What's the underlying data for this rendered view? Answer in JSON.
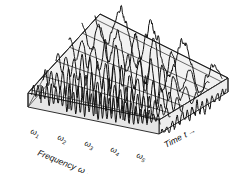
{
  "figure": {
    "name": "waterfall-spectrum-3d",
    "background_color": "#ffffff",
    "line_color": "#111111",
    "top_face_color": "#f2f2f2",
    "front_face_color": "#ededed"
  },
  "axes": {
    "frequency": {
      "title": "Frequency",
      "symbol": "ω",
      "arrow": "→",
      "title_full": "Frequency ω →",
      "tick_labels": [
        {
          "symbol": "ω",
          "sub": "1"
        },
        {
          "symbol": "ω",
          "sub": "2"
        },
        {
          "symbol": "ω",
          "sub": "3"
        },
        {
          "symbol": "ω",
          "sub": "4"
        },
        {
          "symbol": "ω",
          "sub": "5"
        }
      ]
    },
    "time": {
      "title": "Time",
      "symbol": "t",
      "arrow": "→",
      "title_full": "Time t →"
    }
  },
  "chart_data": {
    "type": "line",
    "title": "",
    "xlabel": "Frequency ω →",
    "ylabel": "",
    "zlabel": "Time t →",
    "grid": false,
    "legend": "none",
    "categories": [
      "ω₁",
      "ω₂",
      "ω₃",
      "ω₄",
      "ω₅"
    ],
    "tick_positions": [
      0.08,
      0.26,
      0.44,
      0.62,
      0.78
    ],
    "series": [
      {
        "name": "trace-1",
        "time_index": 1,
        "cycles": 4.0,
        "amplitude": 1.0,
        "noise": 0.4
      },
      {
        "name": "trace-2",
        "time_index": 2,
        "cycles": 7.0,
        "amplitude": 0.85,
        "noise": 0.34
      },
      {
        "name": "trace-3",
        "time_index": 3,
        "cycles": 11.0,
        "amplitude": 0.72,
        "noise": 0.3
      },
      {
        "name": "trace-4",
        "time_index": 4,
        "cycles": 16.0,
        "amplitude": 0.62,
        "noise": 0.26
      },
      {
        "name": "trace-5",
        "time_index": 5,
        "cycles": 22.0,
        "amplitude": 0.55,
        "noise": 0.22
      },
      {
        "name": "trace-6",
        "time_index": 6,
        "cycles": 29.0,
        "amplitude": 0.48,
        "noise": 0.2
      }
    ],
    "front_signal": {
      "name": "time-domain-signal",
      "cycles": 13.0,
      "amplitude": 0.8,
      "noise": 0.75
    }
  }
}
